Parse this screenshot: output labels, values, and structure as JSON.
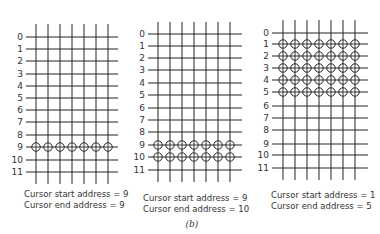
{
  "figure_label": "(b)",
  "panels": [
    {
      "id": "panel-1",
      "grid": {
        "x0": 26,
        "x1": 118,
        "col_x": [
          36,
          48,
          60,
          72,
          84,
          96,
          108
        ],
        "col_top": 24,
        "col_bottom": 184,
        "row_y": [
          37,
          49,
          61,
          74,
          86,
          98,
          110,
          122,
          135,
          147,
          160,
          172
        ]
      },
      "row_labels": [
        "0",
        "1",
        "2",
        "3",
        "4",
        "5",
        "6",
        "7",
        "8",
        "9",
        "10",
        "11"
      ],
      "active_rows": [
        9
      ],
      "caption": {
        "start": "Cursor start address = 9",
        "end": "Cursor end address = 9",
        "x": 24,
        "y_start": 197,
        "y_end": 208
      }
    },
    {
      "id": "panel-2",
      "grid": {
        "x0": 148,
        "x1": 242,
        "col_x": [
          158,
          170,
          182,
          194,
          206,
          218,
          230
        ],
        "col_top": 22,
        "col_bottom": 182,
        "row_y": [
          34,
          46,
          58,
          70,
          83,
          95,
          108,
          120,
          132,
          145,
          157,
          170
        ]
      },
      "row_labels": [
        "0",
        "1",
        "2",
        "3",
        "4",
        "5",
        "6",
        "7",
        "8",
        "9",
        "10",
        "11"
      ],
      "active_rows": [
        9,
        10
      ],
      "caption": {
        "start": "Cursor start address = 9",
        "end": "Cursor end address = 10",
        "x": 143,
        "y_start": 201,
        "y_end": 212
      }
    },
    {
      "id": "panel-3",
      "grid": {
        "x0": 272,
        "x1": 368,
        "col_x": [
          283,
          295,
          307,
          319,
          331,
          343,
          355
        ],
        "col_top": 20,
        "col_bottom": 180,
        "row_y": [
          33,
          44,
          56,
          68,
          80,
          92,
          106,
          118,
          130,
          144,
          155,
          168
        ]
      },
      "row_labels": [
        "0",
        "1",
        "2",
        "3",
        "4",
        "5",
        "6",
        "7",
        "8",
        "9",
        "10",
        "11"
      ],
      "active_rows": [
        1,
        2,
        3,
        4,
        5
      ],
      "caption": {
        "start": "Cursor start address = 1",
        "end": "Cursor end address = 5",
        "x": 271,
        "y_start": 198,
        "y_end": 209
      }
    }
  ],
  "figure_label_pos": {
    "x": 192,
    "y": 227
  },
  "colors": {
    "line": "#222222",
    "text": "#333333",
    "background": "#ffffff"
  }
}
